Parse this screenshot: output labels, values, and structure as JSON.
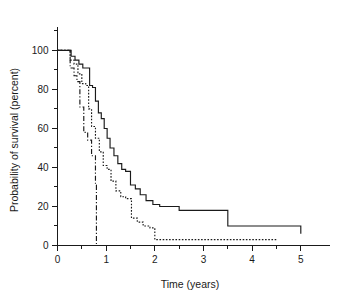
{
  "chart_data": {
    "type": "line",
    "title": "",
    "xlabel": "Time (years)",
    "ylabel": "Probability of survival (percent)",
    "xlim": [
      0,
      5.6
    ],
    "ylim": [
      0,
      112
    ],
    "grid": false,
    "legend": "none",
    "xticks_major": [
      0,
      1,
      2,
      3,
      4,
      5
    ],
    "xticks_major_labels": [
      "0",
      "1",
      "2",
      "3",
      "4",
      "5"
    ],
    "xticks_minor": [
      0.5,
      1.5,
      2.5,
      3.5,
      4.5
    ],
    "yticks_major": [
      0,
      20,
      40,
      60,
      80,
      100
    ],
    "yticks_major_labels": [
      "0",
      "20",
      "40",
      "60",
      "80",
      "100"
    ],
    "yticks_minor": [
      10,
      30,
      50,
      70,
      90,
      110
    ],
    "step_style": "post",
    "series": [
      {
        "name": "curve-solid",
        "style": "solid",
        "x": [
          0.0,
          0.18,
          0.28,
          0.36,
          0.44,
          0.52,
          0.6,
          0.66,
          0.72,
          0.78,
          0.84,
          0.9,
          0.96,
          1.02,
          1.08,
          1.16,
          1.24,
          1.32,
          1.4,
          1.5,
          1.6,
          1.7,
          1.82,
          1.96,
          2.1,
          2.5,
          3.5,
          5.0
        ],
        "y": [
          100,
          100,
          97,
          95,
          93,
          91,
          91,
          82,
          81,
          74,
          68,
          65,
          60,
          55,
          50,
          46,
          42,
          39,
          38,
          31,
          29,
          26,
          23,
          21,
          20,
          18,
          10,
          6
        ]
      },
      {
        "name": "curve-dotted",
        "style": "dotted",
        "x": [
          0.0,
          0.18,
          0.26,
          0.34,
          0.42,
          0.5,
          0.58,
          0.64,
          0.7,
          0.78,
          0.86,
          0.94,
          1.02,
          1.1,
          1.2,
          1.3,
          1.4,
          1.52,
          1.64,
          1.76,
          1.9,
          2.0,
          4.5
        ],
        "y": [
          100,
          100,
          95,
          93,
          88,
          83,
          82,
          70,
          61,
          55,
          48,
          41,
          39,
          33,
          28,
          25,
          24,
          14,
          12,
          10,
          9,
          3,
          3
        ]
      },
      {
        "name": "curve-dashdot",
        "style": "dash-dot",
        "x": [
          0.0,
          0.18,
          0.26,
          0.34,
          0.4,
          0.46,
          0.54,
          0.62,
          0.7,
          0.78,
          0.8,
          0.8
        ],
        "y": [
          100,
          100,
          91,
          87,
          84,
          71,
          58,
          54,
          46,
          31,
          31,
          0
        ]
      }
    ]
  }
}
